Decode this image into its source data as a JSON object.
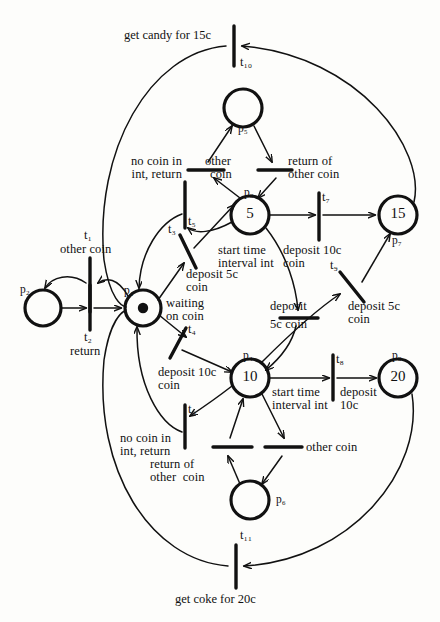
{
  "diagram": {
    "type": "petri-net",
    "colors": {
      "stroke": "#111111",
      "background": "#fdfdfb",
      "token": "#111111"
    }
  },
  "places": [
    {
      "id": "p1",
      "label": "p₁",
      "value": "",
      "tokens": 1,
      "cx": 143,
      "cy": 308,
      "r": 18
    },
    {
      "id": "p2",
      "label": "p₂",
      "value": "",
      "tokens": 0,
      "cx": 43,
      "cy": 308,
      "r": 18
    },
    {
      "id": "p3",
      "label": "p₃",
      "value": "5",
      "tokens": 0,
      "cx": 250,
      "cy": 215,
      "r": 19
    },
    {
      "id": "p4",
      "label": "p₄",
      "value": "10",
      "tokens": 0,
      "cx": 250,
      "cy": 378,
      "r": 19
    },
    {
      "id": "p5",
      "label": "p₅",
      "value": "",
      "tokens": 0,
      "cx": 243,
      "cy": 108,
      "r": 19
    },
    {
      "id": "p6",
      "label": "p₆",
      "value": "",
      "tokens": 0,
      "cx": 250,
      "cy": 500,
      "r": 19
    },
    {
      "id": "p7",
      "label": "p₇",
      "value": "15",
      "tokens": 0,
      "cx": 398,
      "cy": 215,
      "r": 19
    },
    {
      "id": "p8",
      "label": "p₈",
      "value": "20",
      "tokens": 0,
      "cx": 398,
      "cy": 378,
      "r": 19
    }
  ],
  "transitions": [
    {
      "id": "t1",
      "label": "t₁",
      "caption": "other coin"
    },
    {
      "id": "t2",
      "label": "t₂",
      "caption": "return"
    },
    {
      "id": "t3",
      "label": "t₃",
      "caption": "deposit 5c\ncoin"
    },
    {
      "id": "t4",
      "label": "t₄",
      "caption": "deposit 10c\ncoin"
    },
    {
      "id": "t5",
      "label": "t₅",
      "caption": "no coin in\nint, return"
    },
    {
      "id": "t6",
      "label": "t₆",
      "caption": "no coin in\nint, return"
    },
    {
      "id": "t7",
      "label": "t₇",
      "caption": "deposit 10c\ncoin"
    },
    {
      "id": "t8",
      "label": "t₈",
      "caption": "deposit\n10c"
    },
    {
      "id": "t9",
      "label": "t₉",
      "caption": "deposit 5c\ncoin"
    },
    {
      "id": "t10",
      "label": "t₁₀",
      "caption": "get candy for 15c"
    },
    {
      "id": "t11",
      "label": "t₁₁",
      "caption": "get coke for 20c"
    }
  ],
  "annotations": {
    "p1_state": "waiting\non coin",
    "p3_action": "start time\ninterval int",
    "p4_action": "start time\ninterval int",
    "p5_in_left": "other\ncoin",
    "p5_in_right": "return of\nother coin",
    "p6_in_right": "other coin",
    "p6_in_left": "return of\nother  coin",
    "t10_caption": "get candy for 15c",
    "t11_caption": "get coke for 20c"
  },
  "labels": {
    "t1": "t₁",
    "t2": "t₂",
    "t3": "t₃",
    "t4": "t₄",
    "t5": "t₅",
    "t6": "t₆",
    "t7": "t₇",
    "t8": "t₈",
    "t9": "t₉",
    "t10": "t₁₀",
    "t11": "t₁₁",
    "p1": "p₁",
    "p2": "p₂",
    "p3": "p₃",
    "p4": "p₄",
    "p5": "p₅",
    "p6": "p₆",
    "p7": "p₇",
    "p8": "p₈",
    "p3_value": "5",
    "p4_value": "10",
    "p7_value": "15",
    "p8_value": "20",
    "t1_caption": "other coin",
    "t2_caption": "return",
    "t3_caption_l1": "deposit 5c",
    "t3_caption_l2": "coin",
    "t4_caption_l1": "deposit 10c",
    "t4_caption_l2": "coin",
    "t5_caption_l1": "no coin in",
    "t5_caption_l2": "int, return",
    "t6_caption_l1": "no coin in",
    "t6_caption_l2": "int, return",
    "t7_caption_l1": "deposit 10c",
    "t7_caption_l2": "coin",
    "t8_caption_l1": "deposit",
    "t8_caption_l2": "10c",
    "t9_caption_l1": "deposit 5c",
    "t9_caption_l2": "coin",
    "t10_caption": "get candy for 15c",
    "t11_caption": "get coke for 20c",
    "waiting_l1": "waiting",
    "waiting_l2": "on coin",
    "p3_action_l1": "start time",
    "p3_action_l2": "interval int",
    "p4_action_l1": "start time",
    "p4_action_l2": "interval int",
    "other_coin_l1": "other",
    "other_coin_l2": "coin",
    "return_other_l1": "return of",
    "return_other_l2": "other coin",
    "other_coin_low": "other coin",
    "return_other_low_l1": "return of",
    "return_other_low_l2": "other  coin",
    "deposit_5c_mid_l1": "deposit",
    "deposit_5c_mid_l2": "5c coin"
  }
}
